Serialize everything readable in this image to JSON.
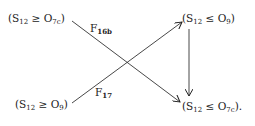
{
  "diagram": {
    "nodes": [
      {
        "id": "tl",
        "s": "S",
        "s_sub": "12",
        "rel": "≥",
        "o": "O",
        "o_sub": "7c",
        "suffix": ""
      },
      {
        "id": "tr",
        "s": "S",
        "s_sub": "12",
        "rel": "≤",
        "o": "O",
        "o_sub": "9",
        "suffix": ""
      },
      {
        "id": "bl",
        "s": "S",
        "s_sub": "12",
        "rel": "≥",
        "o": "O",
        "o_sub": "9",
        "suffix": ""
      },
      {
        "id": "br",
        "s": "S",
        "s_sub": "12",
        "rel": "≤",
        "o": "O",
        "o_sub": "7c",
        "suffix": "."
      }
    ],
    "edges": [
      {
        "from": "tl",
        "to": "br",
        "label": "F",
        "label_sub": "16b"
      },
      {
        "from": "bl",
        "to": "tr",
        "label": "F",
        "label_sub": "17"
      },
      {
        "from": "tr",
        "to": "br",
        "label": "",
        "label_sub": ""
      }
    ]
  }
}
